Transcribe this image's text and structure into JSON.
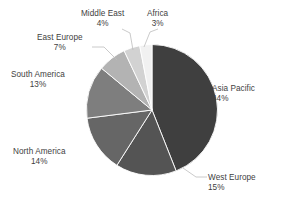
{
  "chart_data": {
    "type": "pie",
    "title": "",
    "subtitle": "",
    "xlabel": "",
    "ylabel": "",
    "legend_position": "none",
    "grid": false,
    "labels_show_percent": true,
    "start_angle_deg": 0,
    "direction": "clockwise",
    "categories": [
      "Asia Pacific",
      "West Europe",
      "North America",
      "South America",
      "East Europe",
      "Middle East",
      "Africa"
    ],
    "values": [
      44,
      15,
      14,
      13,
      7,
      4,
      3
    ],
    "value_labels": [
      "44%",
      "15%",
      "14%",
      "13%",
      "7%",
      "4%",
      "3%"
    ],
    "colors": [
      "#3f3f3f",
      "#545454",
      "#666666",
      "#7e7e7e",
      "#b3b3b3",
      "#d2d2d2",
      "#f1f1f1"
    ],
    "slices": [
      {
        "name": "Asia Pacific",
        "value": 44,
        "value_label": "44%",
        "color": "#3f3f3f"
      },
      {
        "name": "West Europe",
        "value": 15,
        "value_label": "15%",
        "color": "#545454"
      },
      {
        "name": "North America",
        "value": 14,
        "value_label": "14%",
        "color": "#666666"
      },
      {
        "name": "South America",
        "value": 13,
        "value_label": "13%",
        "color": "#7e7e7e"
      },
      {
        "name": "East Europe",
        "value": 7,
        "value_label": "7%",
        "color": "#b3b3b3"
      },
      {
        "name": "Middle East",
        "value": 4,
        "value_label": "4%",
        "color": "#d2d2d2"
      },
      {
        "name": "Africa",
        "value": 3,
        "value_label": "3%",
        "color": "#f1f1f1"
      }
    ]
  },
  "styling": {
    "background": "#ffffff",
    "leader_line_color": "#b9b9b9",
    "slice_border_color": "#ffffff",
    "label_text_color": "#414141"
  }
}
